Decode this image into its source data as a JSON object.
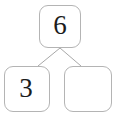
{
  "diagram": {
    "type": "number-bond",
    "whole": {
      "label": "6",
      "name": "whole-box",
      "filled": true
    },
    "parts": [
      {
        "label": "3",
        "name": "part-box-left",
        "filled": true
      },
      {
        "label": "",
        "name": "part-box-right",
        "filled": false
      }
    ],
    "connectors": [
      {
        "name": "connector-left",
        "from": [
          60,
          48
        ],
        "to": [
          38,
          66
        ]
      },
      {
        "name": "connector-right",
        "from": [
          60,
          48
        ],
        "to": [
          81,
          66
        ]
      }
    ],
    "colors": {
      "box_border": "#b4b4b4",
      "box_fill": "#ffffff",
      "digit": "#1c1c1c",
      "connector": "#a8a8a8",
      "background": "#ffffff"
    }
  }
}
